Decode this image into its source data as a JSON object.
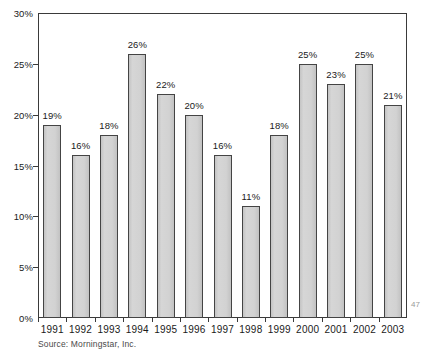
{
  "chart_data": {
    "type": "bar",
    "title": "",
    "subtitle": "",
    "xlabel": "",
    "ylabel": "",
    "categories": [
      "1991",
      "1992",
      "1993",
      "1994",
      "1995",
      "1996",
      "1997",
      "1998",
      "1999",
      "2000",
      "2001",
      "2002",
      "2003"
    ],
    "values": [
      19,
      16,
      18,
      26,
      22,
      20,
      16,
      11,
      18,
      25,
      23,
      25,
      21
    ],
    "data_labels": [
      "19%",
      "16%",
      "18%",
      "26%",
      "22%",
      "20%",
      "16%",
      "11%",
      "18%",
      "25%",
      "23%",
      "25%",
      "21%"
    ],
    "ylim": [
      0,
      30
    ],
    "ytick_values": [
      0,
      5,
      10,
      15,
      20,
      25,
      30
    ],
    "ytick_labels": [
      "0%",
      "5%",
      "10%",
      "15%",
      "20%",
      "25%",
      "30%"
    ],
    "grid": false,
    "legend": false,
    "legend_position": "none",
    "bar_fill_color": "#cdcdcd",
    "bar_border_color": "#444444",
    "axis_color": "#3a3a3a",
    "text_color": "#1a1a1a",
    "background_color": "#ffffff"
  },
  "annotations": {
    "source_note": "Source: Morningstar, Inc.",
    "page_marker": "47"
  }
}
